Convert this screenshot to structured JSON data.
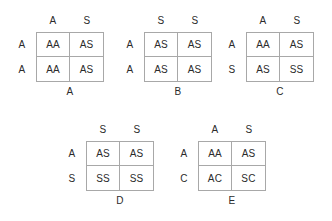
{
  "figure": {
    "background_color": "#ffffff",
    "line_color": "#a8a8a8",
    "text_color": "#2b2b2b"
  },
  "squares": [
    {
      "id": "A",
      "caption": "A",
      "top_alleles": [
        "A",
        "S"
      ],
      "side_alleles": [
        "A",
        "A"
      ],
      "cells": [
        "AA",
        "AS",
        "AA",
        "AS"
      ]
    },
    {
      "id": "B",
      "caption": "B",
      "top_alleles": [
        "S",
        "S"
      ],
      "side_alleles": [
        "A",
        "A"
      ],
      "cells": [
        "AS",
        "AS",
        "AS",
        "AS"
      ]
    },
    {
      "id": "C",
      "caption": "C",
      "top_alleles": [
        "A",
        "S"
      ],
      "side_alleles": [
        "A",
        "S"
      ],
      "cells": [
        "AA",
        "AS",
        "AS",
        "SS"
      ]
    },
    {
      "id": "D",
      "caption": "D",
      "top_alleles": [
        "S",
        "S"
      ],
      "side_alleles": [
        "A",
        "S"
      ],
      "cells": [
        "AS",
        "AS",
        "SS",
        "SS"
      ]
    },
    {
      "id": "E",
      "caption": "E",
      "top_alleles": [
        "A",
        "S"
      ],
      "side_alleles": [
        "A",
        "C"
      ],
      "cells": [
        "AA",
        "AS",
        "AC",
        "SC"
      ]
    }
  ]
}
